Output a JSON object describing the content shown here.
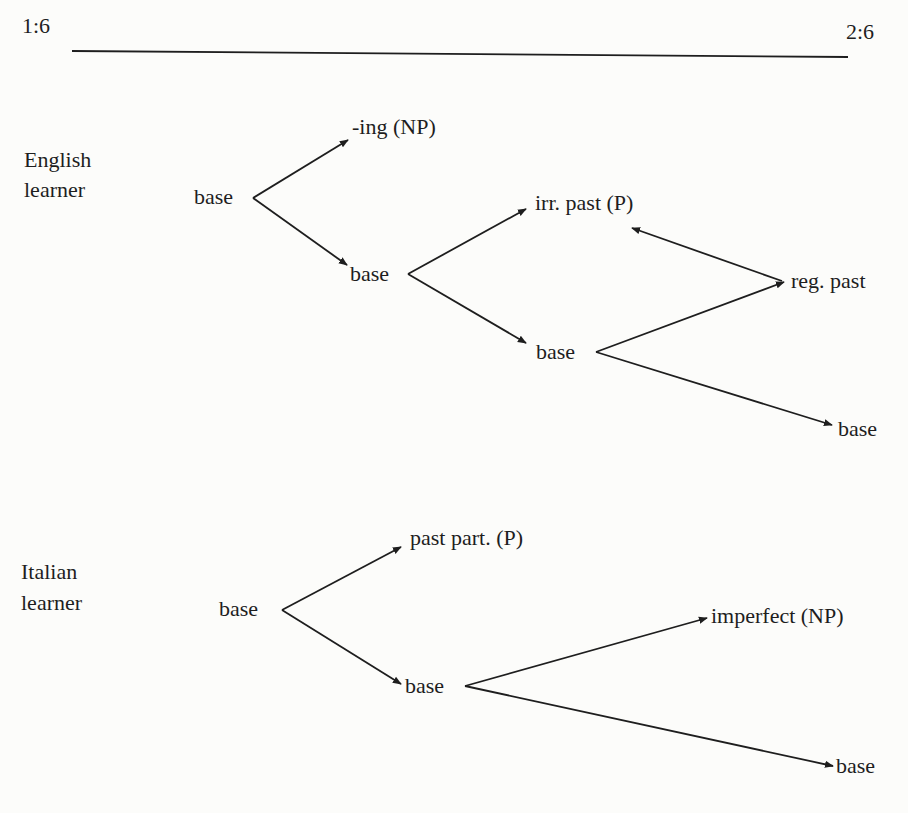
{
  "timeline": {
    "start": "1:6",
    "end": "2:6"
  },
  "groups": [
    {
      "label_line1": "English",
      "label_line2": "learner",
      "nodes": {
        "n1": "base",
        "n2": "-ing (NP)",
        "n3": "base",
        "n4": "irr. past (P)",
        "n5": "base",
        "n6": "reg. past",
        "n7": "base"
      }
    },
    {
      "label_line1": "Italian",
      "label_line2": "learner",
      "nodes": {
        "n1": "base",
        "n2": "past part. (P)",
        "n3": "base",
        "n4": "imperfect (NP)",
        "n5": "base"
      }
    }
  ],
  "colors": {
    "ink": "#1e1e1e",
    "paper": "#fcfcfa"
  }
}
